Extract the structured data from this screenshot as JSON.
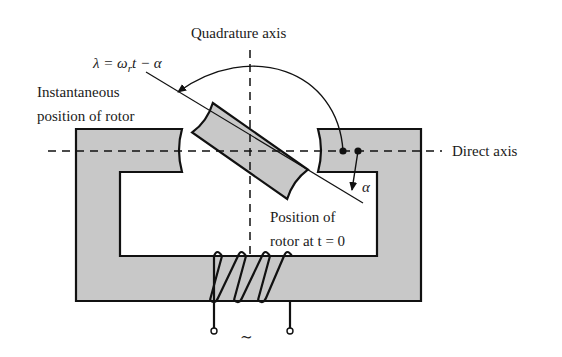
{
  "diagram": {
    "labels": {
      "quadrature_axis": "Quadrature axis",
      "direct_axis": "Direct axis",
      "equation": "λ = ω",
      "equation_sub": "r",
      "equation_tail": "t − α",
      "instantaneous_line1": "Instantaneous",
      "instantaneous_line2": "position of rotor",
      "position_line1": "Position of",
      "position_line2": "rotor at t = 0",
      "alpha": "α",
      "ac_source": "∼"
    },
    "colors": {
      "core_fill": "#c8c8c8",
      "stroke": "#111111",
      "background": "#ffffff"
    }
  }
}
